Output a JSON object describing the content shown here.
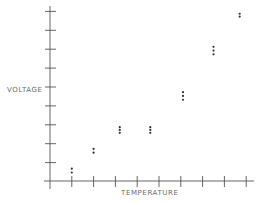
{
  "chart_data": {
    "type": "scatter",
    "title": "",
    "xlabel": "TEMPERATURE",
    "ylabel": "VOLTAGE",
    "x_ticks": 9,
    "y_ticks": 9,
    "x_tick_labels": [],
    "y_tick_labels": [],
    "grid": false,
    "legend": null,
    "xlim": [
      0,
      9.5
    ],
    "ylim": [
      0,
      9.5
    ],
    "series": [
      {
        "name": "measurements",
        "points": [
          {
            "x": 1.0,
            "y": 0.45
          },
          {
            "x": 1.0,
            "y": 0.65
          },
          {
            "x": 2.0,
            "y": 1.5
          },
          {
            "x": 2.0,
            "y": 1.7
          },
          {
            "x": 3.2,
            "y": 2.55
          },
          {
            "x": 3.2,
            "y": 2.7
          },
          {
            "x": 3.2,
            "y": 2.85
          },
          {
            "x": 4.6,
            "y": 2.55
          },
          {
            "x": 4.6,
            "y": 2.7
          },
          {
            "x": 4.6,
            "y": 2.85
          },
          {
            "x": 6.1,
            "y": 4.3
          },
          {
            "x": 6.1,
            "y": 4.5
          },
          {
            "x": 6.1,
            "y": 4.7
          },
          {
            "x": 7.5,
            "y": 6.7
          },
          {
            "x": 7.5,
            "y": 6.9
          },
          {
            "x": 7.5,
            "y": 7.1
          },
          {
            "x": 8.7,
            "y": 8.7
          },
          {
            "x": 8.7,
            "y": 8.85
          }
        ]
      }
    ]
  },
  "colors": {
    "axis": "#555555",
    "points": "#333333",
    "label": "#6a6a6a"
  }
}
